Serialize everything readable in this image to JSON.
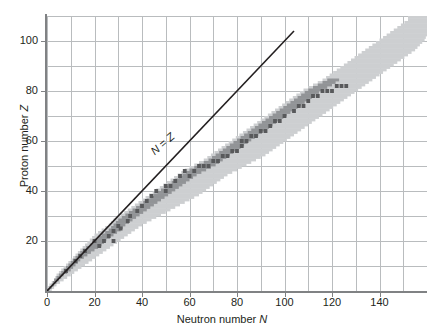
{
  "chart_data": {
    "type": "scatter",
    "title": "",
    "xlabel": "Neutron number N",
    "ylabel": "Proton number Z",
    "xlim": [
      0,
      160
    ],
    "ylim": [
      0,
      110
    ],
    "xticks": [
      0,
      20,
      40,
      60,
      80,
      100,
      120,
      140
    ],
    "yticks": [
      20,
      40,
      60,
      80,
      100
    ],
    "xtick_labels": [
      "0",
      "20",
      "40",
      "60",
      "80",
      "100",
      "120",
      "140"
    ],
    "ytick_labels": [
      "20",
      "40",
      "60",
      "80",
      "100"
    ],
    "x_minor_step": 10,
    "y_minor_step": 10,
    "grid": true,
    "legend": false,
    "annotations": [
      {
        "text": "N = Z",
        "x": 46,
        "y": 53,
        "rotation": -41
      }
    ],
    "reference_line": {
      "name": "N = Z",
      "type": "line",
      "x": [
        0,
        104
      ],
      "y": [
        0,
        104
      ],
      "color": "#231f20"
    },
    "series": [
      {
        "name": "unstable-nuclides",
        "color": "#cdcfd1",
        "description": "Light grey band of known radioactive nuclides"
      },
      {
        "name": "stable-nuclides",
        "color": "#929497",
        "description": "Mid grey band of stable / long-lived nuclides following the valley of stability"
      },
      {
        "name": "magic-nuclides",
        "color": "#58595b",
        "description": "Dark grey squares scattered along the stability band"
      }
    ],
    "stability_band": {
      "comment": "Lower(Z) and upper(Z) neutron-number envelope of the light grey region, sampled every 2 in Z",
      "z": [
        0,
        2,
        4,
        6,
        8,
        10,
        12,
        14,
        16,
        18,
        20,
        22,
        24,
        26,
        28,
        30,
        32,
        34,
        36,
        38,
        40,
        42,
        44,
        46,
        48,
        50,
        52,
        54,
        56,
        58,
        60,
        62,
        64,
        66,
        68,
        70,
        72,
        74,
        76,
        78,
        80,
        82,
        84,
        86,
        88,
        90,
        92,
        94,
        96,
        98,
        100,
        102,
        104,
        106,
        108
      ],
      "n_low": [
        0,
        1,
        3,
        4,
        6,
        8,
        10,
        12,
        14,
        16,
        18,
        20,
        23,
        26,
        28,
        31,
        34,
        37,
        40,
        43,
        46,
        49,
        52,
        55,
        58,
        62,
        66,
        69,
        72,
        75,
        78,
        81,
        84,
        87,
        90,
        93,
        96,
        99,
        102,
        105,
        108,
        112,
        116,
        119,
        122,
        125,
        128,
        131,
        134,
        137,
        140,
        143,
        146,
        149,
        152
      ],
      "n_high": [
        2,
        4,
        7,
        10,
        13,
        16,
        19,
        22,
        25,
        28,
        31,
        34,
        37,
        40,
        44,
        48,
        52,
        56,
        60,
        64,
        67,
        70,
        73,
        76,
        80,
        84,
        88,
        92,
        95,
        98,
        101,
        104,
        107,
        110,
        113,
        116,
        119,
        122,
        125,
        128,
        131,
        134,
        137,
        140,
        143,
        146,
        149,
        152,
        155,
        157,
        159,
        160,
        160,
        160,
        160
      ],
      "n_stable_low": [
        0,
        2,
        3,
        5,
        7,
        9,
        11,
        13,
        15,
        18,
        20,
        23,
        26,
        28,
        30,
        33,
        36,
        39,
        42,
        45,
        48,
        51,
        54,
        57,
        60,
        64,
        68,
        71,
        74,
        77,
        80,
        83,
        86,
        89,
        92,
        95,
        98,
        101,
        104,
        107,
        110,
        114,
        118,
        121,
        124,
        127,
        130,
        133,
        136,
        139,
        142,
        145,
        148,
        151,
        154
      ],
      "n_stable_high": [
        1,
        3,
        5,
        7,
        10,
        12,
        14,
        17,
        20,
        23,
        25,
        28,
        31,
        33,
        36,
        39,
        42,
        45,
        48,
        51,
        54,
        57,
        60,
        63,
        67,
        71,
        74,
        77,
        80,
        83,
        86,
        89,
        92,
        95,
        98,
        101,
        104,
        107,
        110,
        113,
        116,
        120,
        123,
        126,
        129,
        132,
        135,
        138,
        141,
        144,
        147,
        150,
        153,
        156,
        159
      ]
    },
    "dark_points": [
      {
        "n": 8,
        "z": 8
      },
      {
        "n": 12,
        "z": 12
      },
      {
        "n": 14,
        "z": 14
      },
      {
        "n": 16,
        "z": 16
      },
      {
        "n": 20,
        "z": 20
      },
      {
        "n": 22,
        "z": 18
      },
      {
        "n": 24,
        "z": 20
      },
      {
        "n": 26,
        "z": 22
      },
      {
        "n": 28,
        "z": 24
      },
      {
        "n": 28,
        "z": 20
      },
      {
        "n": 30,
        "z": 26
      },
      {
        "n": 31,
        "z": 25
      },
      {
        "n": 34,
        "z": 28
      },
      {
        "n": 35,
        "z": 30
      },
      {
        "n": 38,
        "z": 32
      },
      {
        "n": 40,
        "z": 34
      },
      {
        "n": 42,
        "z": 36
      },
      {
        "n": 44,
        "z": 38
      },
      {
        "n": 46,
        "z": 40
      },
      {
        "n": 50,
        "z": 40
      },
      {
        "n": 50,
        "z": 42
      },
      {
        "n": 52,
        "z": 42
      },
      {
        "n": 54,
        "z": 44
      },
      {
        "n": 56,
        "z": 46
      },
      {
        "n": 58,
        "z": 48
      },
      {
        "n": 60,
        "z": 46
      },
      {
        "n": 62,
        "z": 48
      },
      {
        "n": 64,
        "z": 50
      },
      {
        "n": 66,
        "z": 50
      },
      {
        "n": 68,
        "z": 50
      },
      {
        "n": 70,
        "z": 52
      },
      {
        "n": 72,
        "z": 52
      },
      {
        "n": 74,
        "z": 54
      },
      {
        "n": 76,
        "z": 54
      },
      {
        "n": 78,
        "z": 56
      },
      {
        "n": 80,
        "z": 56
      },
      {
        "n": 82,
        "z": 58
      },
      {
        "n": 82,
        "z": 60
      },
      {
        "n": 84,
        "z": 60
      },
      {
        "n": 86,
        "z": 62
      },
      {
        "n": 88,
        "z": 62
      },
      {
        "n": 90,
        "z": 64
      },
      {
        "n": 92,
        "z": 64
      },
      {
        "n": 94,
        "z": 66
      },
      {
        "n": 96,
        "z": 68
      },
      {
        "n": 98,
        "z": 68
      },
      {
        "n": 100,
        "z": 70
      },
      {
        "n": 104,
        "z": 72
      },
      {
        "n": 106,
        "z": 74
      },
      {
        "n": 108,
        "z": 74
      },
      {
        "n": 110,
        "z": 76
      },
      {
        "n": 112,
        "z": 78
      },
      {
        "n": 114,
        "z": 78
      },
      {
        "n": 116,
        "z": 80
      },
      {
        "n": 118,
        "z": 80
      },
      {
        "n": 120,
        "z": 80
      },
      {
        "n": 122,
        "z": 82
      },
      {
        "n": 124,
        "z": 82
      },
      {
        "n": 126,
        "z": 82
      }
    ]
  },
  "axes": {
    "xlabel_prefix": "Neutron number ",
    "xlabel_symbol": "N",
    "ylabel_prefix": "Proton number ",
    "ylabel_symbol": "Z"
  },
  "annotation": {
    "nz_prefix": "N",
    "nz_mid": " = ",
    "nz_suffix": "Z"
  },
  "colors": {
    "unstable": "#cdcfd1",
    "stable": "#929497",
    "dark": "#58595b",
    "grid": "#b9bcbe",
    "axis": "#808284",
    "text": "#231f20",
    "background": "#ffffff"
  }
}
